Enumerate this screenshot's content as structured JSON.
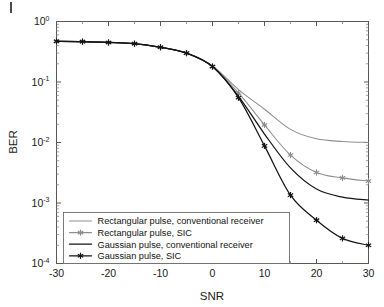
{
  "chart_data": {
    "type": "line",
    "title": "",
    "xlabel": "SNR",
    "ylabel": "BER",
    "xlim": [
      -30,
      30
    ],
    "ylim": [
      0.0001,
      1
    ],
    "yscale": "log",
    "grid": false,
    "legend_position": "lower-left-inside",
    "x": [
      -30,
      -25,
      -20,
      -15,
      -10,
      -5,
      0,
      5,
      10,
      15,
      20,
      25,
      30
    ],
    "xticks": [
      -30,
      -20,
      -10,
      0,
      10,
      20,
      30
    ],
    "xticklabels": [
      "-30",
      "-20",
      "-10",
      "0",
      "10",
      "20",
      "30"
    ],
    "yticks": [
      1,
      0.1,
      0.01,
      0.001,
      0.0001
    ],
    "yticklabels": [
      "10^0",
      "10^-1",
      "10^-2",
      "10^-3",
      "10^-4"
    ],
    "ytick_mantissa": [
      "10",
      "10",
      "10",
      "10",
      "10"
    ],
    "ytick_exponent": [
      "0",
      "-1",
      "-2",
      "-3",
      "-4"
    ],
    "series": [
      {
        "name": "Rectangular pulse, conventional receiver",
        "color": "#8e8e90",
        "marker": "none",
        "linewidth": 1.05,
        "values": [
          0.47,
          0.465,
          0.45,
          0.43,
          0.375,
          0.3,
          0.185,
          0.075,
          0.0355,
          0.0165,
          0.0115,
          0.0104,
          0.01
        ]
      },
      {
        "name": "Rectangular pulse, SIC",
        "color": "#8e8e90",
        "marker": "star",
        "linewidth": 1.05,
        "values": [
          0.47,
          0.465,
          0.45,
          0.43,
          0.375,
          0.3,
          0.18,
          0.066,
          0.0195,
          0.0062,
          0.0032,
          0.0026,
          0.0023
        ]
      },
      {
        "name": "Gaussian pulse, conventional receiver",
        "color": "#141414",
        "marker": "none",
        "linewidth": 1.25,
        "values": [
          0.47,
          0.465,
          0.45,
          0.43,
          0.375,
          0.3,
          0.18,
          0.058,
          0.0138,
          0.0038,
          0.0017,
          0.00125,
          0.00112
        ]
      },
      {
        "name": "Gaussian pulse, SIC",
        "color": "#141414",
        "marker": "star",
        "linewidth": 1.25,
        "values": [
          0.47,
          0.465,
          0.45,
          0.43,
          0.375,
          0.3,
          0.18,
          0.055,
          0.0088,
          0.00135,
          0.00052,
          0.00026,
          0.0002
        ]
      }
    ]
  },
  "legend": {
    "entries": [
      {
        "label": "Rectangular pulse, conventional receiver",
        "color": "#8e8e90",
        "marker": "none"
      },
      {
        "label": "Rectangular pulse, SIC",
        "color": "#8e8e90",
        "marker": "star"
      },
      {
        "label": "Gaussian pulse, conventional receiver",
        "color": "#141414",
        "marker": "none"
      },
      {
        "label": "Gaussian pulse, SIC",
        "color": "#141414",
        "marker": "star"
      }
    ]
  },
  "axes": {
    "x_title": "SNR",
    "y_title": "BER"
  }
}
